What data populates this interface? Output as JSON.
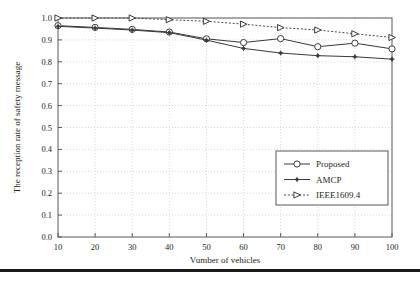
{
  "chart_data": {
    "type": "line",
    "title": "",
    "xlabel": "Vumber of vehicles",
    "ylabel": "The reception rate of safety message",
    "x": [
      10,
      20,
      30,
      40,
      50,
      60,
      70,
      80,
      90,
      100
    ],
    "xlim": [
      10,
      100
    ],
    "ylim": [
      0.0,
      1.0
    ],
    "xticks": [
      "10",
      "20",
      "30",
      "40",
      "50",
      "60",
      "70",
      "80",
      "90",
      "100"
    ],
    "yticks": [
      "0.0",
      "0.1",
      "0.2",
      "0.3",
      "0.4",
      "0.5",
      "0.6",
      "0.7",
      "0.8",
      "0.9",
      "1.0"
    ],
    "grid": true,
    "legend_position": "lower right",
    "series": [
      {
        "name": "Proposed",
        "marker": "open-circle",
        "linestyle": "solid",
        "color": "#3a3a3a",
        "values": [
          0.965,
          0.957,
          0.948,
          0.936,
          0.905,
          0.888,
          0.906,
          0.869,
          0.885,
          0.859
        ]
      },
      {
        "name": "AMCP",
        "marker": "filled-star",
        "linestyle": "solid",
        "color": "#3a3a3a",
        "values": [
          0.962,
          0.954,
          0.945,
          0.933,
          0.899,
          0.861,
          0.84,
          0.828,
          0.823,
          0.812
        ]
      },
      {
        "name": "IEEE1609.4",
        "marker": "open-triangle",
        "linestyle": "dotted",
        "color": "#4a4a4a",
        "values": [
          1.0,
          1.0,
          1.0,
          0.992,
          0.985,
          0.972,
          0.956,
          0.945,
          0.928,
          0.911
        ]
      }
    ]
  },
  "legend": {
    "entries": [
      {
        "label": "Proposed"
      },
      {
        "label": "AMCP"
      },
      {
        "label": "IEEE1609.4"
      }
    ]
  }
}
